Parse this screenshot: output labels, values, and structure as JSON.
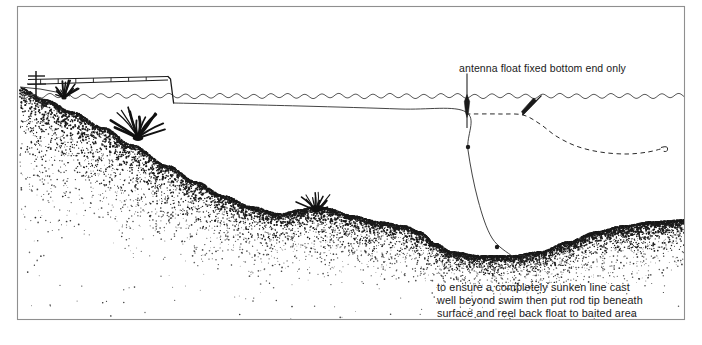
{
  "figure": {
    "width": 702,
    "height": 345,
    "background_color": "#ffffff",
    "ink_color": "#1a1a1a",
    "border_color": "#8a8a8a"
  },
  "annotations": {
    "float_label": "antenna float fixed bottom end only",
    "method_label": "to ensure a completely sunken line cast\nwell beyond swim then put rod tip beneath\nsurface and reel back float to baited area"
  },
  "scene": {
    "border": {
      "x": 17,
      "y": 6,
      "width": 668,
      "height": 314
    },
    "water_surface": {
      "y": 96,
      "x_start": 20,
      "x_end": 684,
      "wave_amplitude": 2.2,
      "wave_period": 17
    },
    "bank": {
      "description": "left bank sloping down into stippled lake bed",
      "top_y": 88,
      "x": 20
    },
    "lake_bed": {
      "description": "stippled silt bed sloping from left bank down to a trough then rising at right",
      "profile_points": [
        [
          20,
          88
        ],
        [
          46,
          100
        ],
        [
          72,
          112
        ],
        [
          104,
          128
        ],
        [
          132,
          145
        ],
        [
          168,
          166
        ],
        [
          196,
          182
        ],
        [
          224,
          196
        ],
        [
          252,
          207
        ],
        [
          280,
          214
        ],
        [
          300,
          210
        ],
        [
          316,
          206
        ],
        [
          330,
          209
        ],
        [
          352,
          216
        ],
        [
          380,
          222
        ],
        [
          404,
          226
        ],
        [
          420,
          232
        ],
        [
          436,
          244
        ],
        [
          452,
          252
        ],
        [
          480,
          256
        ],
        [
          512,
          256
        ],
        [
          540,
          252
        ],
        [
          568,
          242
        ],
        [
          596,
          232
        ],
        [
          624,
          226
        ],
        [
          652,
          222
        ],
        [
          684,
          220
        ]
      ],
      "stipple_color": "#1a1a1a"
    },
    "weeds": [
      {
        "name": "bank-edge-weed",
        "x": 64,
        "y": 98,
        "scale": 0.62
      },
      {
        "name": "slope-weed-clump",
        "x": 138,
        "y": 138,
        "scale": 1.25
      },
      {
        "name": "bed-weed",
        "x": 316,
        "y": 211,
        "scale": 0.74
      }
    ],
    "rod": {
      "name": "fishing-rod-on-rest",
      "butt": [
        29,
        82
      ],
      "tip": [
        171,
        79
      ],
      "tip_submerged_to": [
        174,
        103
      ],
      "rod_rest_x": 36,
      "rod_rest_top_y": 72,
      "rod_rest_bottom_y": 100,
      "whipping_count": 7
    },
    "sunken_line": {
      "name": "sunken-main-line",
      "description": "line from submerged rod tip running just under the surface to the float, then down to the hook on the bed",
      "surface_run": [
        [
          174,
          103
        ],
        [
          300,
          106
        ],
        [
          400,
          109
        ],
        [
          466,
          112
        ]
      ],
      "drop": [
        [
          466,
          112
        ],
        [
          468,
          150
        ],
        [
          478,
          200
        ],
        [
          492,
          238
        ],
        [
          512,
          256
        ]
      ],
      "shot": [
        {
          "name": "shot-upper",
          "x": 468,
          "y": 147,
          "r": 2.2
        },
        {
          "name": "shot-lower",
          "x": 497,
          "y": 247,
          "r": 2.2
        }
      ],
      "hook": {
        "x": 525,
        "y": 256
      }
    },
    "antenna_float": {
      "name": "antenna-float-upright",
      "x": 467,
      "antenna_top_y": 74,
      "body_top_y": 96,
      "body_bottom_y": 116,
      "body_half_width": 2.6
    },
    "cast_position_float": {
      "name": "cast-float-tilted",
      "from": [
        541,
        96
      ],
      "to": [
        523,
        115
      ]
    },
    "dashed_cast_line": {
      "name": "original-cast-line-dashed",
      "description": "dashed line showing the line lying on the surface immediately after the cast, ending in a hook beyond the swim",
      "points": [
        [
          466,
          114
        ],
        [
          500,
          114
        ],
        [
          523,
          115
        ],
        [
          540,
          124
        ],
        [
          556,
          136
        ],
        [
          576,
          146
        ],
        [
          600,
          152
        ],
        [
          626,
          154
        ],
        [
          648,
          152
        ],
        [
          664,
          148
        ]
      ],
      "hook_end": {
        "x": 668,
        "y": 146
      }
    }
  }
}
